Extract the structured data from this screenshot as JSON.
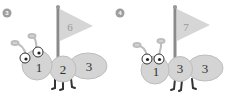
{
  "colors": {
    "body": "#d4d4d4",
    "body_stroke": "#bdbdbd",
    "flag": "#d6d6d6",
    "pole": "#8a8a8a",
    "badge": "#9e9e9e",
    "legs": "#333333"
  },
  "puzzles": [
    {
      "badge": "3",
      "flag": "6",
      "segments": [
        "1",
        "2",
        "3"
      ]
    },
    {
      "badge": "4",
      "flag": "7",
      "segments": [
        "1",
        "3",
        "3"
      ]
    }
  ]
}
